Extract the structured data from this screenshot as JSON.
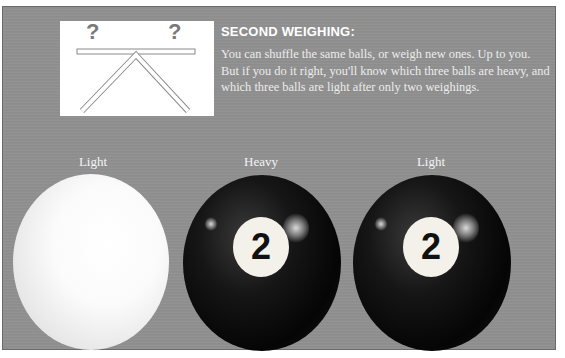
{
  "diagram": {
    "left_mark": "?",
    "right_mark": "?",
    "mark_color": "#7a7a7a"
  },
  "heading": "SECOND WEIGHING:",
  "body": "You can shuffle the same balls, or weigh new ones. Up to you. But if you do it right, you'll know which three balls are heavy, and which three balls are light after only two weighings.",
  "balls": [
    {
      "label": "Light",
      "type": "white-ball",
      "number": ""
    },
    {
      "label": "Heavy",
      "type": "black-ball",
      "number": "2"
    },
    {
      "label": "Light",
      "type": "black-ball",
      "number": "2"
    }
  ],
  "colors": {
    "panel": "#8f8f8f",
    "heading": "#ffffff",
    "text": "#ececec"
  }
}
